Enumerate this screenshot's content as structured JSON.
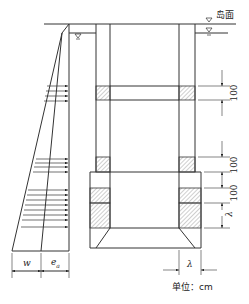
{
  "diagram": {
    "type": "caisson-section-with-earth-pressure",
    "labels": {
      "island_surface": "岛面",
      "unit": "单位：cm",
      "w": "w",
      "ea": "e",
      "ea_sub": "a",
      "lambda_side": "λ",
      "lambda_bottom": "λ"
    },
    "dimensions": [
      "100",
      "100",
      "100"
    ],
    "colors": {
      "line": "#333333",
      "hatch": "#888888",
      "background": "#ffffff"
    }
  }
}
